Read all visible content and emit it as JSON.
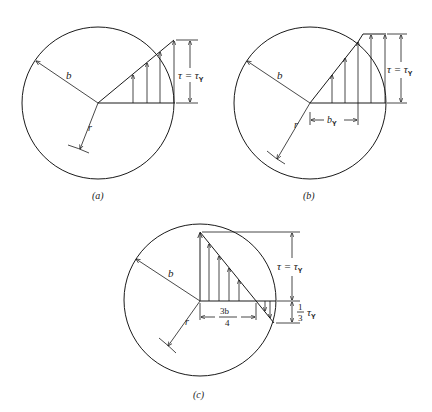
{
  "figure": {
    "panels": [
      {
        "id": "a",
        "caption": "(a)",
        "radius_label": "b",
        "r_label": "r",
        "stress_label": "τ = τ",
        "stress_sub": "Y"
      },
      {
        "id": "b",
        "caption": "(b)",
        "radius_label": "b",
        "r_label": "r",
        "stress_label": "τ = τ",
        "stress_sub": "Y",
        "elastic_core_label": "b",
        "elastic_core_sub": "Y"
      },
      {
        "id": "c",
        "caption": "(c)",
        "radius_label": "b",
        "r_label": "r",
        "stress_label": "τ = τ",
        "stress_sub": "Y",
        "position_num": "3b",
        "position_den": "4",
        "residual_num": "1",
        "residual_den": "3",
        "residual_tau": "τ",
        "residual_sub": "Y"
      }
    ]
  },
  "colors": {
    "ink": "#1a1a1a",
    "background": "#ffffff"
  }
}
